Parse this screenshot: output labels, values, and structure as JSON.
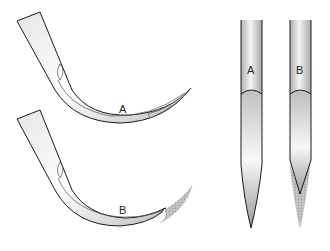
{
  "figure": {
    "type": "needle tip comparison illustration",
    "panels": [
      {
        "id": "curved-a",
        "label": "A",
        "description": "curved needle with intact tip"
      },
      {
        "id": "curved-b",
        "label": "B",
        "description": "curved needle with tip removed; original outline shown shaded"
      },
      {
        "id": "straight-a",
        "label": "A",
        "description": "straight needle with intact tapered tip"
      },
      {
        "id": "straight-b",
        "label": "B",
        "description": "straight needle with shortened tip; original outline shown shaded"
      }
    ],
    "colors": {
      "outline": "#1a1a1a",
      "metal_light": "#f2f2f2",
      "metal_mid": "#c8c8c8",
      "metal_dark": "#9a9a9a",
      "removed_region": "#b5b5b5"
    }
  }
}
